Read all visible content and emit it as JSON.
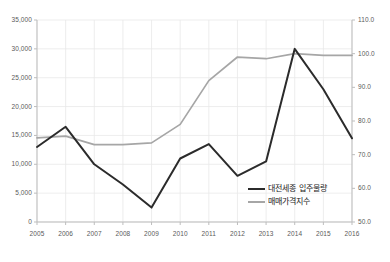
{
  "chart_data": {
    "type": "line",
    "title": "",
    "xlabel": "",
    "categories": [
      "2005",
      "2006",
      "2007",
      "2008",
      "2009",
      "2010",
      "2011",
      "2012",
      "2013",
      "2014",
      "2015",
      "2016"
    ],
    "grid": true,
    "legend_position": "inside-bottom-right",
    "axes": {
      "left": {
        "label": "",
        "ylim": [
          0,
          35000
        ],
        "ticks": [
          0,
          5000,
          10000,
          15000,
          20000,
          25000,
          30000,
          35000
        ],
        "tick_labels": [
          "0",
          "5,000",
          "10,000",
          "15,000",
          "20,000",
          "25,000",
          "30,000",
          "35,000"
        ]
      },
      "right": {
        "label": "",
        "ylim": [
          50.0,
          110.0
        ],
        "ticks": [
          50.0,
          60.0,
          70.0,
          80.0,
          90.0,
          100.0,
          110.0
        ],
        "tick_labels": [
          "50.0",
          "60.0",
          "70.0",
          "80.0",
          "90.0",
          "100.0",
          "110.0"
        ]
      }
    },
    "series": [
      {
        "name": "대전세종 입주물량",
        "axis": "left",
        "color": "#2b2b2b",
        "values": [
          13000,
          16500,
          10000,
          6500,
          2500,
          11000,
          13500,
          8000,
          10500,
          30000,
          23000,
          14500
        ]
      },
      {
        "name": "매매가격지수",
        "axis": "right",
        "color": "#a6a6a6",
        "values": [
          75.0,
          75.5,
          73.0,
          73.0,
          73.5,
          79.0,
          92.0,
          99.0,
          98.5,
          100.0,
          99.5,
          99.5
        ]
      }
    ]
  },
  "legend": {
    "items": [
      {
        "label": "대전세종 입주물량",
        "color": "#2b2b2b"
      },
      {
        "label": "매매가격지수",
        "color": "#a6a6a6"
      }
    ]
  },
  "colors": {
    "grid": "#e8e8e8",
    "axis": "#bdbdbd",
    "tick_text": "#5a5a5a",
    "background": "#ffffff"
  }
}
